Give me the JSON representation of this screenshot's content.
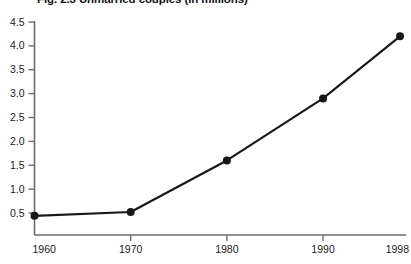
{
  "chart_data": {
    "type": "line",
    "title": "Fig. 2.3 Unmarried couples (in millions)",
    "xlabel": "",
    "ylabel": "",
    "x": [
      1960,
      1970,
      1980,
      1990,
      1998
    ],
    "values": [
      0.44,
      0.52,
      1.6,
      2.9,
      4.2
    ],
    "series": [
      {
        "name": "Unmarried couples (in millions)",
        "values": [
          0.44,
          0.52,
          1.6,
          2.9,
          4.2
        ]
      }
    ],
    "xtick_labels": [
      "1960",
      "1970",
      "1980",
      "1990",
      "1998"
    ],
    "ytick_labels": [
      "0.5",
      "1.0",
      "1.5",
      "2.0",
      "2.5",
      "3.0",
      "3.5",
      "4.0",
      "4.5"
    ],
    "ytick_values": [
      0.5,
      1.0,
      1.5,
      2.0,
      2.5,
      3.0,
      3.5,
      4.0,
      4.5
    ],
    "ylim": [
      0.28,
      4.5
    ],
    "xlim": [
      1960,
      1998
    ],
    "grid": false,
    "legend": "none",
    "markers": "filled-circle",
    "line_color": "#171717",
    "axis_color": "#6d6d6d",
    "background_color": "#ffffff"
  },
  "axes": {
    "y_ticks": [
      {
        "label": "4.5",
        "value": 4.5
      },
      {
        "label": "4.0",
        "value": 4.0
      },
      {
        "label": "3.5",
        "value": 3.5
      },
      {
        "label": "3.0",
        "value": 3.0
      },
      {
        "label": "2.5",
        "value": 2.5
      },
      {
        "label": "2.0",
        "value": 2.0
      },
      {
        "label": "1.5",
        "value": 1.5
      },
      {
        "label": "1.0",
        "value": 1.0
      },
      {
        "label": "0.5",
        "value": 0.5
      }
    ],
    "x_ticks": [
      {
        "label": "1960",
        "value": 1960
      },
      {
        "label": "1970",
        "value": 1970
      },
      {
        "label": "1980",
        "value": 1980
      },
      {
        "label": "1990",
        "value": 1990
      },
      {
        "label": "1998",
        "value": 1998
      }
    ]
  }
}
